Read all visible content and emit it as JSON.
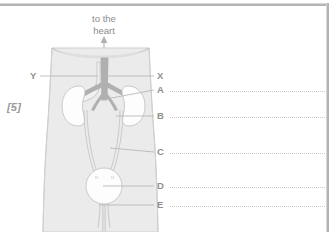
{
  "question": {
    "marks": "[5]",
    "diagram_caption_line1": "to the",
    "diagram_caption_line2": "heart"
  },
  "labels": [
    {
      "id": "label-Y",
      "text": "Y",
      "side": "left",
      "x": 30,
      "y": 70,
      "leader_from_x": 40,
      "leader_to_x": 98,
      "leader_y": 76,
      "has_answer_line": false
    },
    {
      "id": "label-X",
      "text": "X",
      "side": "right",
      "x": 157,
      "y": 70,
      "leader_from_x": 104,
      "leader_to_x": 154,
      "leader_y": 76,
      "has_answer_line": false
    },
    {
      "id": "label-A",
      "text": "A",
      "side": "right",
      "x": 157,
      "y": 84,
      "leader_from_x": 101,
      "leader_to_x": 154,
      "leader_y": 90,
      "has_answer_line": true,
      "answer_x": 170,
      "answer_w": 155,
      "answer_y": 91
    },
    {
      "id": "label-B",
      "text": "B",
      "side": "right",
      "x": 157,
      "y": 110,
      "leader_from_x": 116,
      "leader_to_x": 154,
      "leader_y": 116,
      "has_answer_line": true,
      "answer_x": 170,
      "answer_w": 155,
      "answer_y": 117
    },
    {
      "id": "label-C",
      "text": "C",
      "side": "right",
      "x": 157,
      "y": 146,
      "leader_from_x": 110,
      "leader_to_x": 154,
      "leader_y": 152,
      "has_answer_line": true,
      "answer_x": 170,
      "answer_w": 155,
      "answer_y": 153
    },
    {
      "id": "label-D",
      "text": "D",
      "side": "right",
      "x": 157,
      "y": 180,
      "leader_from_x": 103,
      "leader_to_x": 154,
      "leader_y": 186,
      "has_answer_line": true,
      "answer_x": 170,
      "answer_w": 155,
      "answer_y": 187
    },
    {
      "id": "label-E",
      "text": "E",
      "side": "right",
      "x": 157,
      "y": 199,
      "leader_from_x": 99,
      "leader_to_x": 154,
      "leader_y": 205,
      "has_answer_line": true,
      "answer_x": 170,
      "answer_w": 155,
      "answer_y": 206
    }
  ],
  "colors": {
    "body_fill": "#ebebeb",
    "body_stroke": "#cfcfcf",
    "organ_fill": "#fdfdfd",
    "organ_stroke": "#cacaca",
    "vessel_dark": "#b0b0b0",
    "vessel_light": "#e4e4e4",
    "leader_line": "#b8b8b8",
    "dotted_rule": "#c9c9c9",
    "text": "#8f8f8f",
    "frame": "#b3b3b3",
    "page_background": "#ffffff"
  }
}
